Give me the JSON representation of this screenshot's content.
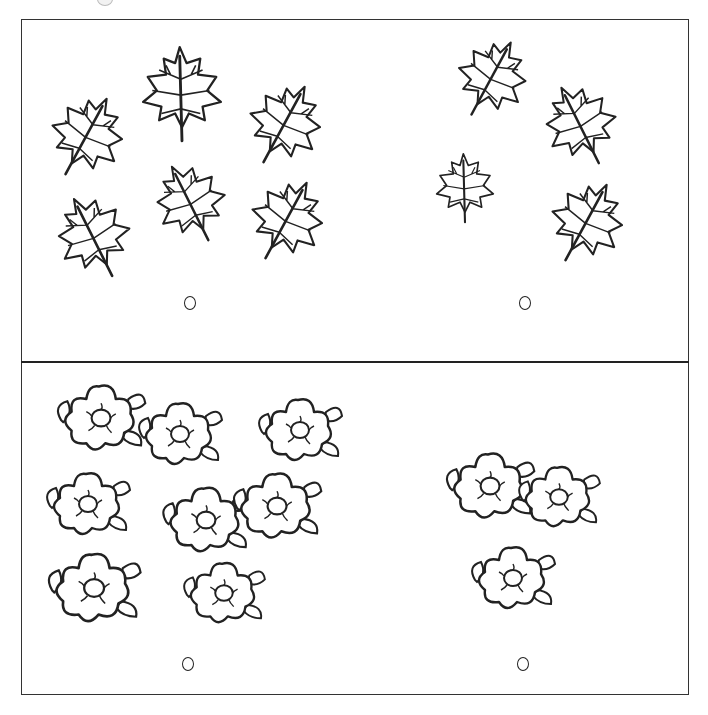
{
  "worksheet": {
    "title": "",
    "sections": [
      {
        "name": "leaves",
        "groups": [
          {
            "side": "left",
            "item": "maple-leaf",
            "count": 6,
            "answer_circle": ""
          },
          {
            "side": "right",
            "item": "maple-leaf",
            "count": 4,
            "answer_circle": ""
          }
        ]
      },
      {
        "name": "flowers",
        "groups": [
          {
            "side": "left",
            "item": "flower",
            "count": 8,
            "answer_circle": ""
          },
          {
            "side": "right",
            "item": "flower",
            "count": 3,
            "answer_circle": ""
          }
        ]
      }
    ],
    "colors": {
      "ink": "#222222",
      "paper": "#ffffff"
    }
  }
}
